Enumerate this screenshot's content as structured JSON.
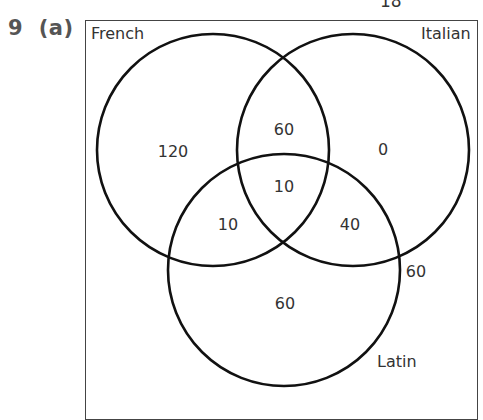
{
  "page": {
    "page_number": "18",
    "question_label": "9  (a)"
  },
  "diagram": {
    "type": "venn",
    "sets": [
      {
        "name": "French",
        "cx": 213,
        "cy": 150,
        "r": 116
      },
      {
        "name": "Italian",
        "cx": 353,
        "cy": 150,
        "r": 116
      },
      {
        "name": "Latin",
        "cx": 284,
        "cy": 270,
        "r": 116
      }
    ],
    "regions": {
      "french_only": "120",
      "italian_only": "0",
      "latin_only": "60",
      "french_italian_only": "60",
      "french_latin_only": "10",
      "italian_latin_only": "40",
      "all_three": "10",
      "none": "60"
    },
    "colors": {
      "stroke": "#111111",
      "text": "#333333",
      "label": "#555555",
      "frame": "#444444"
    }
  }
}
